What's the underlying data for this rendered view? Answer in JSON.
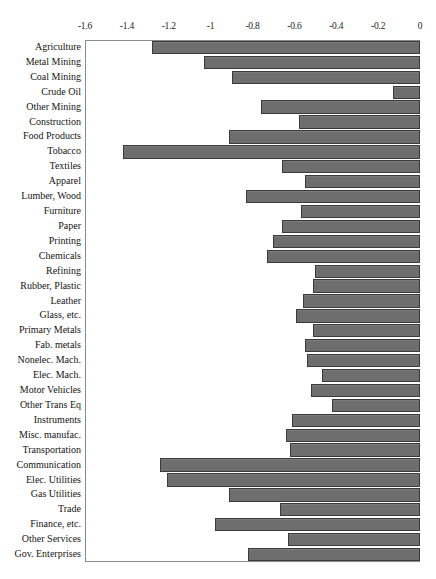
{
  "chart_data": {
    "type": "bar",
    "orientation": "horizontal",
    "title": "",
    "subtitle": "",
    "xlabel": "",
    "ylabel": "",
    "xlim": [
      -1.6,
      0
    ],
    "ylim": null,
    "grid": false,
    "legend": null,
    "bar_color": "#6e6e6e",
    "bar_edge_color": "#3a3a3a",
    "axis_color": "#8a8a8a",
    "tick_labels": [
      "-1.6",
      "-1.4",
      "-1.2",
      "-1",
      "-0.8",
      "-0.6",
      "-0.4",
      "-0.2",
      "0"
    ],
    "tick_values": [
      -1.6,
      -1.4,
      -1.2,
      -1.0,
      -0.8,
      -0.6,
      -0.4,
      -0.2,
      0
    ],
    "categories": [
      "Agriculture",
      "Metal Mining",
      "Coal Mining",
      "Crude Oil",
      "Other Mining",
      "Construction",
      "Food Products",
      "Tobacco",
      "Textiles",
      "Apparel",
      "Lumber, Wood",
      "Furniture",
      "Paper",
      "Printing",
      "Chemicals",
      "Refining",
      "Rubber, Plastic",
      "Leather",
      "Glass, etc.",
      "Primary Metals",
      "Fab. metals",
      "Nonelec. Mach.",
      "Elec. Mach.",
      "Motor Vehicles",
      "Other Trans Eq",
      "Instruments",
      "Misc. manufac.",
      "Transportation",
      "Communication",
      "Elec. Utilities",
      "Gas Utilities",
      "Trade",
      "Finance, etc.",
      "Other Services",
      "Gov. Enterprises"
    ],
    "values": [
      -1.28,
      -1.03,
      -0.9,
      -0.13,
      -0.76,
      -0.58,
      -0.91,
      -1.42,
      -0.66,
      -0.55,
      -0.83,
      -0.57,
      -0.66,
      -0.7,
      -0.73,
      -0.5,
      -0.51,
      -0.56,
      -0.59,
      -0.51,
      -0.55,
      -0.54,
      -0.47,
      -0.52,
      -0.42,
      -0.61,
      -0.64,
      -0.62,
      -1.24,
      -1.21,
      -0.91,
      -0.67,
      -0.98,
      -0.63,
      -0.82
    ]
  }
}
